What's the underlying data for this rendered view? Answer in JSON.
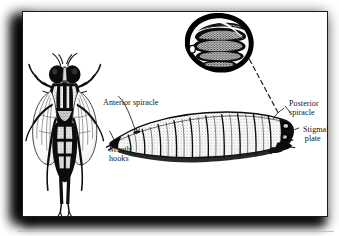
{
  "figure": {
    "domain": "scanned-biology-figure",
    "caption_absent": true,
    "background_color": "#ffffff",
    "plate": {
      "background_color": "#ffffff",
      "border_color": "#1c1c1c",
      "shadow_color": "#000000"
    },
    "ink_color": "#141414"
  },
  "labels": {
    "anterior_spiracle": "Anterior spiracle",
    "mouth_hooks_line1": "Mouth",
    "mouth_hooks_line2": "hooks",
    "posterior_spiracle_line1": "Posterior",
    "posterior_spiracle_line2": "spiracle",
    "stigmal_plate_line1": "Stigmal",
    "stigmal_plate_line2": "plate"
  },
  "illustrations": {
    "adult_fly": {
      "name": "adult-fly-dorsal-view",
      "description": "Dorsal view of an adult fly with striped thorax, two veined wings and six splayed legs"
    },
    "larva": {
      "name": "fly-larva-lateral-view",
      "description": "Lateral view of a segmented fly larva (maggot) tapering toward the head at left",
      "segment_count": 11
    },
    "spiracle_inset": {
      "name": "posterior-spiracle-magnified-inset",
      "description": "Magnified roughly circular posterior spiracle with three sinuous slits and a peritreme button",
      "slit_count": 3
    },
    "leader_lines": {
      "inset_to_larva_style": "dashed",
      "label_to_part_style": "solid-thin"
    }
  }
}
